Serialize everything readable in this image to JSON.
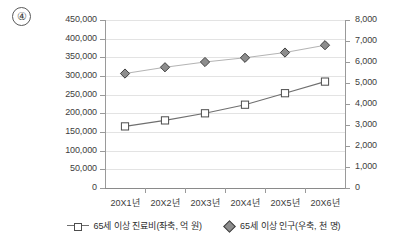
{
  "question_marker": "④",
  "chart_data": {
    "type": "line",
    "title": "",
    "xlabel": "",
    "categories": [
      "20X1년",
      "20X2년",
      "20X3년",
      "20X4년",
      "20X5년",
      "20X6년"
    ],
    "grid": true,
    "legend_position": "bottom",
    "axes": {
      "left": {
        "label": "",
        "ylim": [
          0,
          450000
        ],
        "tick_step": 50000,
        "ticks": [
          "0",
          "50,000",
          "100,000",
          "150,000",
          "200,000",
          "250,000",
          "300,000",
          "350,000",
          "400,000",
          "450,000"
        ]
      },
      "right": {
        "label": "",
        "ylim": [
          0,
          8000
        ],
        "tick_step": 1000,
        "ticks": [
          "0",
          "1,000",
          "2,000",
          "3,000",
          "4,000",
          "5,000",
          "6,000",
          "7,000",
          "8,000"
        ]
      }
    },
    "series": [
      {
        "name": "65세 이상 진료비(좌축, 억 원)",
        "axis": "left",
        "marker": "square",
        "marker_fill": "#ffffff",
        "marker_stroke": "#4d4d4d",
        "line_color": "#6f6f6f",
        "values": [
          165000,
          181000,
          200000,
          223000,
          254000,
          285000
        ]
      },
      {
        "name": "65세 이상 인구(우축, 천 명)",
        "axis": "right",
        "marker": "diamond",
        "marker_fill": "#8d8d8d",
        "marker_stroke": "#3f3f3f",
        "line_color": "#b4b4b4",
        "values": [
          5450,
          5750,
          6000,
          6200,
          6450,
          6800
        ]
      }
    ]
  },
  "legend": {
    "items": [
      {
        "label": "65세 이상 진료비(좌축, 억 원)",
        "key": "square-line-key"
      },
      {
        "label": "65세 이상 인구(우축, 천 명)",
        "key": "diamond-key"
      }
    ]
  }
}
